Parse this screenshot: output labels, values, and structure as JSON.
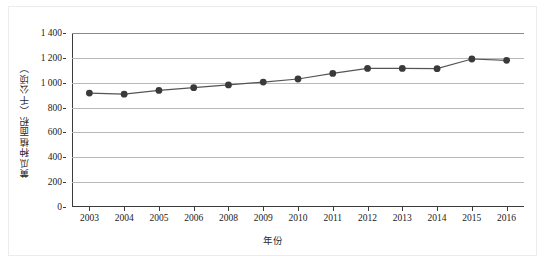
{
  "chart_data": {
    "type": "line",
    "title": "",
    "xlabel": "年份",
    "ylabel": "黄瓜种植面积（千公顷）",
    "categories": [
      "2003",
      "2004",
      "2005",
      "2006",
      "2008",
      "2009",
      "2010",
      "2011",
      "2012",
      "2013",
      "2014",
      "2015",
      "2016"
    ],
    "values": [
      917,
      908,
      938,
      960,
      982,
      1005,
      1030,
      1075,
      1115,
      1115,
      1113,
      1191,
      1180
    ],
    "series": [
      {
        "name": "黄瓜种植面积",
        "values": [
          917,
          908,
          938,
          960,
          982,
          1005,
          1030,
          1075,
          1115,
          1115,
          1113,
          1191,
          1180
        ]
      }
    ],
    "ylim": [
      0,
      1400
    ],
    "ytick_values": [
      0,
      200,
      400,
      600,
      800,
      1000,
      1200,
      1400
    ],
    "ytick_labels": [
      "0",
      "200",
      "400",
      "600",
      "800",
      "1 000",
      "1 200",
      "1 400"
    ],
    "grid": "horizontal",
    "legend": "none",
    "marker": "filled-circle",
    "line_color": "#555555",
    "marker_color": "#3a3a3a",
    "grid_color": "#b9b9b9",
    "axis_color": "#3b3b3b",
    "note": "2007 is absent from the category axis"
  }
}
